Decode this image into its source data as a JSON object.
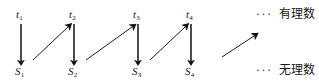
{
  "diagram": {
    "type": "alternating-sequence-arrow-diagram",
    "colors": {
      "ink": "#1a1a1a",
      "arrow": "#111111",
      "background": "#ffffff"
    },
    "top_row": {
      "legend_ellipsis": "···",
      "legend_label": "有理数",
      "nodes": [
        {
          "label": "t",
          "subscript": "1",
          "x": 16,
          "y": 9
        },
        {
          "label": "t",
          "subscript": "2",
          "x": 69,
          "y": 9
        },
        {
          "label": "t",
          "subscript": "3",
          "x": 133,
          "y": 9
        },
        {
          "label": "t",
          "subscript": "4",
          "x": 186,
          "y": 9
        }
      ]
    },
    "bottom_row": {
      "legend_ellipsis": "···",
      "legend_label": "无理数",
      "nodes": [
        {
          "label": "S",
          "subscript": "1",
          "x": 15,
          "y": 66
        },
        {
          "label": "S",
          "subscript": "2",
          "x": 68,
          "y": 66
        },
        {
          "label": "S",
          "subscript": "3",
          "x": 132,
          "y": 66
        },
        {
          "label": "S",
          "subscript": "4",
          "x": 185,
          "y": 66
        }
      ]
    },
    "down_arrows": [
      {
        "name": "t1-to-S1",
        "x1": 21,
        "y1": 24,
        "x2": 21,
        "y2": 61
      },
      {
        "name": "t2-to-S2",
        "x1": 74,
        "y1": 24,
        "x2": 74,
        "y2": 61
      },
      {
        "name": "t3-to-S3",
        "x1": 138,
        "y1": 24,
        "x2": 138,
        "y2": 61
      },
      {
        "name": "t4-to-S4",
        "x1": 191,
        "y1": 24,
        "x2": 191,
        "y2": 61
      }
    ],
    "diagonal_arrows": [
      {
        "name": "S1-to-t2",
        "x1": 33,
        "y1": 60,
        "x2": 68,
        "y2": 27
      },
      {
        "name": "S2-to-t3",
        "x1": 86,
        "y1": 60,
        "x2": 132,
        "y2": 27
      },
      {
        "name": "S3-to-t4",
        "x1": 150,
        "y1": 60,
        "x2": 185,
        "y2": 27
      },
      {
        "name": "S4-to-t5",
        "x1": 222,
        "y1": 57,
        "x2": 254,
        "y2": 36
      }
    ],
    "legend_positions": {
      "top": {
        "x": 256,
        "y": 8
      },
      "bottom": {
        "x": 256,
        "y": 64
      }
    }
  }
}
